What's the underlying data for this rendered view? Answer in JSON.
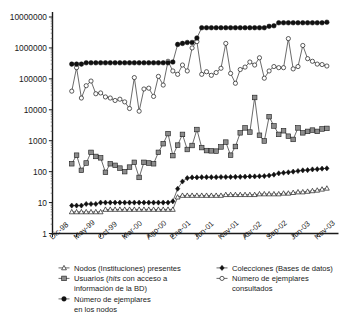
{
  "chart_data": {
    "type": "line",
    "title": "",
    "subtitle": "",
    "xlabel": "",
    "ylabel": "",
    "yscale": "log",
    "ylim": [
      1,
      10000000
    ],
    "grid": false,
    "legend_position": "bottom",
    "ytick_labels": [
      "1",
      "10",
      "100",
      "1000",
      "10000",
      "100000",
      "1000000",
      "10000000"
    ],
    "ytick_values": [
      1,
      10,
      100,
      1000,
      10000,
      100000,
      1000000,
      10000000
    ],
    "xtick_labels": [
      "Dic-98",
      "May-99",
      "Oct-99",
      "Mar-00",
      "Ago-00",
      "Ene-01",
      "Jun-01",
      "Nov-01",
      "Abr-02",
      "Sep-02",
      "Jun-03",
      "Nov-03"
    ],
    "xtick_positions": [
      0,
      5,
      10,
      15,
      20,
      25,
      30,
      35,
      40,
      45,
      50,
      55
    ],
    "xlim": [
      0,
      59
    ],
    "series": [
      {
        "name": "Nodos (Instituciones) presentes",
        "marker": "triangle-open",
        "color": "#1a1a1a",
        "x": [
          4,
          5,
          6,
          7,
          8,
          9,
          10,
          11,
          12,
          13,
          14,
          15,
          16,
          17,
          18,
          19,
          20,
          21,
          22,
          23,
          24,
          25,
          26,
          27,
          28,
          29,
          30,
          31,
          32,
          33,
          34,
          35,
          36,
          37,
          38,
          39,
          40,
          41,
          42,
          43,
          44,
          45,
          46,
          47,
          48,
          49,
          50,
          51,
          52,
          53,
          54,
          55,
          56,
          57
        ],
        "values": [
          5,
          5,
          5,
          5,
          5,
          5,
          5,
          6,
          6,
          6,
          6,
          6,
          6,
          6,
          6,
          6,
          6,
          6,
          6,
          6,
          6,
          6,
          15,
          17,
          17,
          17,
          17,
          17,
          17,
          17,
          17,
          17,
          18,
          18,
          18,
          18,
          18,
          18,
          18,
          19,
          19,
          19,
          19,
          19,
          20,
          20,
          21,
          22,
          22,
          23,
          24,
          25,
          27,
          29
        ]
      },
      {
        "name": "Colecciones (Bases de datos)",
        "marker": "square-solid",
        "color": "#111111",
        "x": [
          4,
          5,
          6,
          7,
          8,
          9,
          10,
          11,
          12,
          13,
          14,
          15,
          16,
          17,
          18,
          19,
          20,
          21,
          22,
          23,
          24,
          25,
          26,
          27,
          28,
          29,
          30,
          31,
          32,
          33,
          34,
          35,
          36,
          37,
          38,
          39,
          40,
          41,
          42,
          43,
          44,
          45,
          46,
          47,
          48,
          49,
          50,
          51,
          52,
          53,
          54,
          55,
          56,
          57
        ],
        "values": [
          8,
          8,
          8,
          9,
          9,
          9,
          10,
          10,
          10,
          10,
          10,
          10,
          10,
          10,
          10,
          10,
          10,
          10,
          10,
          10,
          10,
          11,
          28,
          48,
          62,
          65,
          65,
          66,
          66,
          66,
          66,
          67,
          67,
          67,
          68,
          68,
          69,
          70,
          70,
          71,
          72,
          75,
          80,
          88,
          92,
          95,
          100,
          105,
          110,
          112,
          118,
          120,
          125,
          128
        ]
      },
      {
        "name": "Usuarios (hits con acceso a información de la BD)",
        "marker": "square-gray",
        "color": "#8c8c8c",
        "x": [
          4,
          5,
          6,
          7,
          8,
          9,
          10,
          11,
          12,
          13,
          14,
          15,
          16,
          17,
          18,
          19,
          20,
          21,
          22,
          23,
          24,
          25,
          26,
          27,
          28,
          29,
          30,
          31,
          32,
          33,
          34,
          35,
          36,
          37,
          38,
          39,
          40,
          41,
          42,
          43,
          44,
          45,
          46,
          47,
          48,
          49,
          50,
          51,
          52,
          53,
          54,
          55,
          56,
          57
        ],
        "values": [
          180,
          340,
          110,
          190,
          420,
          310,
          280,
          95,
          180,
          160,
          130,
          100,
          140,
          200,
          65,
          200,
          190,
          180,
          420,
          800,
          1700,
          330,
          720,
          1600,
          520,
          700,
          2300,
          600,
          480,
          470,
          460,
          630,
          900,
          340,
          650,
          1800,
          2600,
          1900,
          25000,
          1500,
          980,
          6000,
          3000,
          1600,
          2100,
          1400,
          1100,
          2600,
          1800,
          2000,
          2200,
          2000,
          2400,
          2500
        ]
      },
      {
        "name": "Número de ejemplares consultados",
        "marker": "circle-open",
        "color": "#1a1a1a",
        "x": [
          4,
          5,
          6,
          7,
          8,
          9,
          10,
          11,
          12,
          13,
          14,
          15,
          16,
          17,
          18,
          19,
          20,
          21,
          22,
          23,
          24,
          25,
          26,
          27,
          28,
          29,
          30,
          31,
          32,
          33,
          34,
          35,
          36,
          37,
          38,
          39,
          40,
          41,
          42,
          43,
          44,
          45,
          46,
          47,
          48,
          49,
          50,
          51,
          52,
          53,
          54,
          55,
          56,
          57
        ],
        "values": [
          40000,
          230000,
          24000,
          60000,
          85000,
          33000,
          35000,
          26000,
          24000,
          20000,
          22000,
          18000,
          11000,
          110000,
          9000,
          47000,
          50000,
          27000,
          120000,
          63000,
          370000,
          180000,
          140000,
          280000,
          180000,
          1000000,
          1600000,
          140000,
          170000,
          130000,
          160000,
          220000,
          1400000,
          150000,
          72000,
          200000,
          240000,
          350000,
          280000,
          480000,
          105000,
          180000,
          250000,
          230000,
          230000,
          2000000,
          210000,
          250000,
          1200000,
          450000,
          370000,
          300000,
          290000,
          260000
        ]
      },
      {
        "name": "Número de ejemplares en los nodos",
        "marker": "hex-solid",
        "color": "#111111",
        "x": [
          4,
          5,
          6,
          7,
          8,
          9,
          10,
          11,
          12,
          13,
          14,
          15,
          16,
          17,
          18,
          19,
          20,
          21,
          22,
          23,
          24,
          25,
          26,
          27,
          28,
          29,
          30,
          31,
          32,
          33,
          34,
          35,
          36,
          37,
          38,
          39,
          40,
          41,
          42,
          43,
          44,
          45,
          46,
          47,
          48,
          49,
          50,
          51,
          52,
          53,
          54,
          55,
          56,
          57
        ],
        "values": [
          300000,
          300000,
          300000,
          330000,
          330000,
          330000,
          330000,
          330000,
          330000,
          330000,
          330000,
          330000,
          330000,
          330000,
          330000,
          330000,
          330000,
          330000,
          330000,
          330000,
          330000,
          350000,
          1300000,
          1400000,
          1500000,
          1500000,
          2100000,
          4500000,
          4500000,
          4500000,
          4500000,
          4500000,
          4500000,
          4500000,
          4500000,
          4500000,
          4500000,
          4500000,
          4500000,
          4500000,
          4500000,
          5000000,
          5200000,
          6500000,
          6500000,
          6500000,
          6500000,
          6500000,
          6500000,
          6500000,
          6500000,
          6500000,
          6500000,
          6800000
        ]
      }
    ]
  },
  "legend": {
    "entries": [
      {
        "id": "nodos",
        "marker": "triangle-open-marker",
        "line1": "Nodos (Instituciones) presentes",
        "line2": ""
      },
      {
        "id": "usuarios",
        "marker": "gray-square-marker",
        "line1_a": "Usuarios (",
        "line1_b": "hits",
        "line1_c": " con acceso a",
        "line2": "información de la BD)"
      },
      {
        "id": "ejemplares-nodos",
        "marker": "solid-square-marker",
        "line1": "Número de ejemplares",
        "line2": "en los nodos"
      },
      {
        "id": "colecciones",
        "marker": "solid-diamond-marker",
        "line1": "Colecciones (Bases de datos)",
        "line2": ""
      },
      {
        "id": "consultados",
        "marker": "open-circle-marker",
        "line1": "Número de ejemplares",
        "line2": "consultados"
      }
    ]
  }
}
